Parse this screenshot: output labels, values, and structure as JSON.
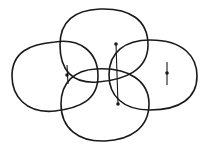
{
  "diagram": {
    "stroke_color": "#1a1a1a",
    "background": "#ffffff",
    "shapes": [
      {
        "name": "left",
        "path": "M 55 42 C 80 38, 98 52, 98 76 C 98 100, 80 108, 55 111 C 25 114, 12 95, 12 76 C 12 52, 30 44, 55 42 Z"
      },
      {
        "name": "top",
        "path": "M 100 9 C 130 8, 148 20, 148 45 C 148 70, 125 80, 98 82 C 72 84, 60 70, 60 45 C 60 20, 75 10, 100 9 Z"
      },
      {
        "name": "right",
        "path": "M 150 40 C 185 40, 197 58, 197 76 C 197 98, 180 110, 150 110 C 122 110, 109 95, 109 75 C 109 52, 125 40, 150 40 Z"
      },
      {
        "name": "bottom",
        "path": "M 96 69 C 130 67, 149 82, 149 104 C 149 128, 130 140, 105 141 C 78 142, 61 128, 61 104 C 61 82, 75 70, 96 69 Z"
      }
    ],
    "segments": [
      {
        "name": "center-vertical",
        "x1": 116,
        "y1": 44,
        "x2": 118,
        "y2": 104
      },
      {
        "name": "left-short",
        "x1": 67,
        "y1": 65,
        "x2": 68,
        "y2": 84
      },
      {
        "name": "right-short",
        "x1": 167,
        "y1": 62,
        "x2": 167,
        "y2": 85
      }
    ],
    "points": [
      {
        "name": "center-top",
        "cx": 116,
        "cy": 44
      },
      {
        "name": "center-bottom",
        "cx": 118,
        "cy": 104
      },
      {
        "name": "left-mid",
        "cx": 67,
        "cy": 75
      },
      {
        "name": "right-mid",
        "cx": 167,
        "cy": 73
      }
    ]
  }
}
